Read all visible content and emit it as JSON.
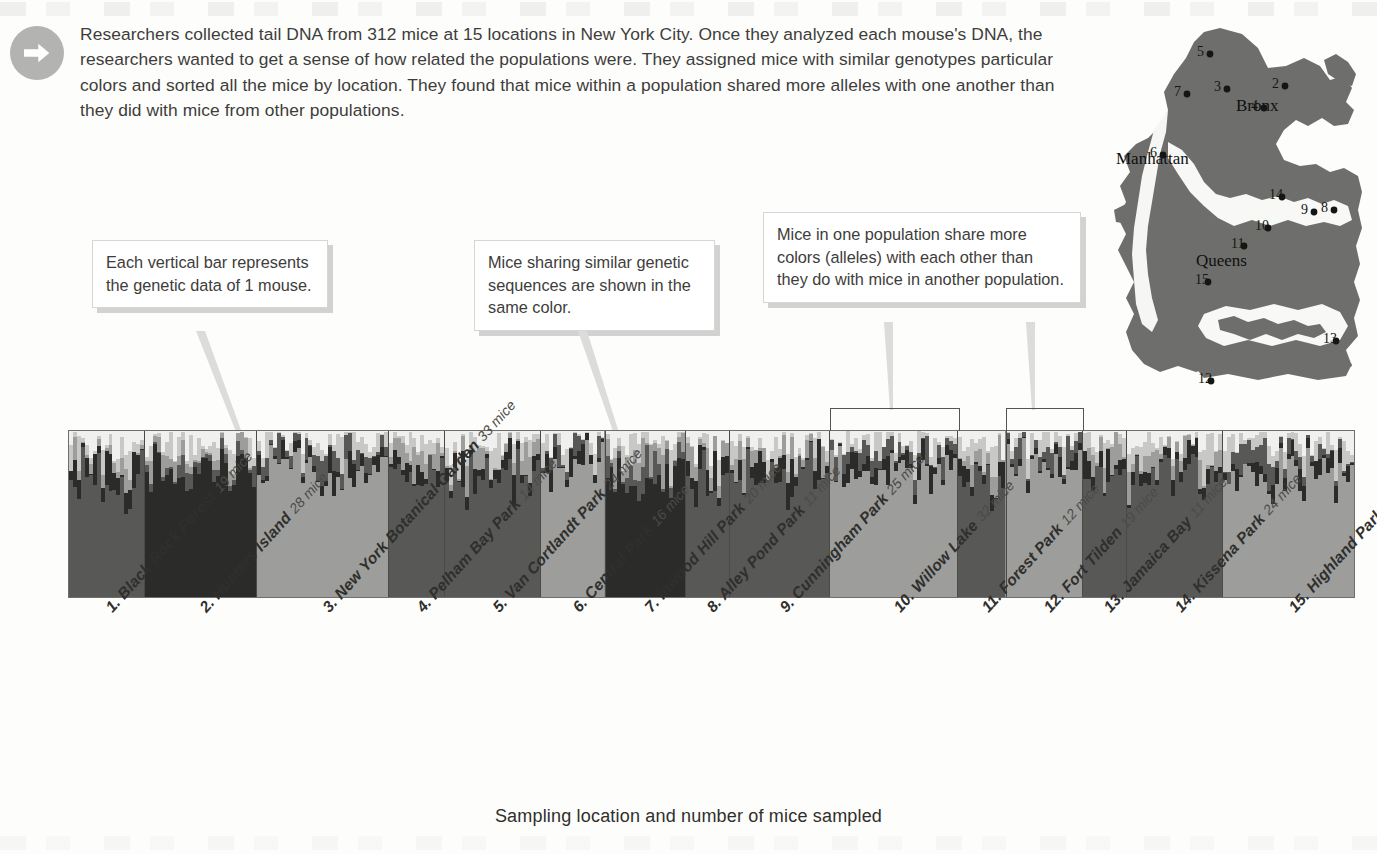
{
  "intro": {
    "icon": "arrow-right-circle-icon",
    "text": "Researchers collected tail DNA from 312 mice at 15 locations in New York City. Once they analyzed each mouse's DNA, the researchers wanted to get a sense of how related the populations were. They assigned mice with similar genotypes particular colors and sorted all the mice by location. They found that mice within a population shared more alleles with one another than they did with mice from other populations."
  },
  "callouts": [
    {
      "id": "callout-1",
      "text": "Each vertical bar represents the genetic data of 1 mouse."
    },
    {
      "id": "callout-2",
      "text": "Mice sharing similar genetic sequences are shown in the same color."
    },
    {
      "id": "callout-3",
      "text": "Mice in one population share more colors (alleles) with each other than they do with mice in another population."
    }
  ],
  "axis": {
    "caption": "Sampling location and number of mice sampled",
    "total_mice": 312,
    "total_locations": 15
  },
  "map": {
    "boroughs": [
      {
        "name": "Bronx",
        "x": 128,
        "y": 97
      },
      {
        "name": "Manhattan",
        "x": 8,
        "y": 150
      },
      {
        "name": "Queens",
        "x": 88,
        "y": 252
      }
    ],
    "markers": [
      {
        "n": "2",
        "x": 177,
        "y": 72
      },
      {
        "n": "3",
        "x": 119,
        "y": 75
      },
      {
        "n": "4",
        "x": 156,
        "y": 94
      },
      {
        "n": "5",
        "x": 102,
        "y": 40
      },
      {
        "n": "6",
        "x": 55,
        "y": 141
      },
      {
        "n": "7",
        "x": 79,
        "y": 80
      },
      {
        "n": "8",
        "x": 226,
        "y": 196
      },
      {
        "n": "9",
        "x": 206,
        "y": 198
      },
      {
        "n": "10",
        "x": 160,
        "y": 214
      },
      {
        "n": "11",
        "x": 136,
        "y": 232
      },
      {
        "n": "12",
        "x": 103,
        "y": 367
      },
      {
        "n": "13",
        "x": 228,
        "y": 327
      },
      {
        "n": "14",
        "x": 174,
        "y": 183
      },
      {
        "n": "15",
        "x": 100,
        "y": 268
      }
    ]
  },
  "chart_data": {
    "type": "bar",
    "chart_kind": "structure-admixture-plot",
    "title": "",
    "xlabel": "Sampling location and number of mice sampled",
    "ylabel": "",
    "ylim": [
      0,
      1
    ],
    "grid": false,
    "legend": "none",
    "note": "Each vertical bar is one mouse; bar is split into colored (gray-level) segments giving that mouse's ancestry proportion per genetic cluster.",
    "cluster_colors": [
      "#2b2b29",
      "#585856",
      "#9d9d9b",
      "#c8c8c6",
      "#f0f0ee"
    ],
    "categories": [
      "1. Black Rock Forest",
      "2. Hunters Island",
      "3. New York Botanical Garden",
      "4. Pelham Bay Park",
      "5. Van Cortlandt Park",
      "6. Central Park",
      "7. Inwood Hill Park",
      "8. Alley Pond Park",
      "9. Cunningham Park",
      "10. Willow Lake",
      "11. Forest Park",
      "12. Fort Tilden",
      "13. Jamaica Bay",
      "14. Kissena Park",
      "15. Highland Park"
    ],
    "values": [
      19,
      28,
      33,
      14,
      24,
      16,
      20,
      11,
      25,
      32,
      12,
      19,
      11,
      24,
      33
    ],
    "populations": [
      {
        "id": 1,
        "name": "Black Rock Forest",
        "label": "1. Black Rock Forest",
        "count": 19,
        "count_label": "19 mice",
        "dominant": 1,
        "purity": 0.76
      },
      {
        "id": 2,
        "name": "Hunters Island",
        "label": "2. Hunters Island",
        "count": 28,
        "count_label": "28 mice",
        "dominant": 0,
        "purity": 0.88
      },
      {
        "id": 3,
        "name": "New York Botanical Garden",
        "label": "3. New York Botanical Garden",
        "count": 33,
        "count_label": "33 mice",
        "dominant": 2,
        "purity": 0.82
      },
      {
        "id": 4,
        "name": "Pelham Bay Park",
        "label": "4. Pelham Bay Park",
        "count": 14,
        "count_label": "14 mice",
        "dominant": 1,
        "purity": 0.8
      },
      {
        "id": 5,
        "name": "Van Cortlandt Park",
        "label": "5. Van Cortlandt Park",
        "count": 24,
        "count_label": "24 mice",
        "dominant": 1,
        "purity": 0.72
      },
      {
        "id": 6,
        "name": "Central Park",
        "label": "6. Central Park",
        "count": 16,
        "count_label": "16 mice",
        "dominant": 2,
        "purity": 0.86
      },
      {
        "id": 7,
        "name": "Inwood Hill Park",
        "label": "7. Inwood Hill Park",
        "count": 20,
        "count_label": "20 mice",
        "dominant": 0,
        "purity": 0.74
      },
      {
        "id": 8,
        "name": "Alley Pond Park",
        "label": "8. Alley Pond Park",
        "count": 11,
        "count_label": "11 mice",
        "dominant": 1,
        "purity": 0.7
      },
      {
        "id": 9,
        "name": "Cunningham Park",
        "label": "9. Cunningham Park",
        "count": 25,
        "count_label": "25 mice",
        "dominant": 1,
        "purity": 0.78
      },
      {
        "id": 10,
        "name": "Willow Lake",
        "label": "10. Willow Lake",
        "count": 32,
        "count_label": "32 mice",
        "dominant": 2,
        "purity": 0.9
      },
      {
        "id": 11,
        "name": "Forest Park",
        "label": "11. Forest Park",
        "count": 12,
        "count_label": "12 mice",
        "dominant": 1,
        "purity": 0.62
      },
      {
        "id": 12,
        "name": "Fort Tilden",
        "label": "12. Fort Tilden",
        "count": 19,
        "count_label": "19 mice",
        "dominant": 2,
        "purity": 0.93
      },
      {
        "id": 13,
        "name": "Jamaica Bay",
        "label": "13. Jamaica Bay",
        "count": 11,
        "count_label": "11 mice",
        "dominant": 1,
        "purity": 0.8
      },
      {
        "id": 14,
        "name": "Kissena Park",
        "label": "14. Kissena Park",
        "count": 24,
        "count_label": "24 mice",
        "dominant": 1,
        "purity": 0.76
      },
      {
        "id": 15,
        "name": "Highland Park",
        "label": "15. Highland Park",
        "count": 33,
        "count_label": "33 mice",
        "dominant": 2,
        "purity": 0.88
      }
    ],
    "brackets": [
      {
        "population_id": 10,
        "callout": "callout-3"
      },
      {
        "population_id": 12,
        "callout": "callout-3"
      }
    ]
  }
}
